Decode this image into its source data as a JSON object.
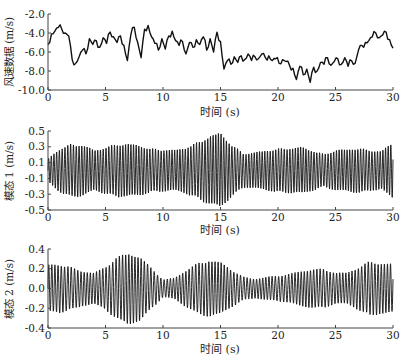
{
  "chart_data": [
    {
      "type": "line",
      "title": "",
      "xlabel": "时间 (s)",
      "ylabel": "风速数据 (m/s)",
      "xlim": [
        0,
        30
      ],
      "ylim": [
        -10.0,
        -2.0
      ],
      "xticks": [
        0,
        5,
        10,
        15,
        20,
        25,
        30
      ],
      "yticks": [
        -2.0,
        -4.0,
        -6.0,
        -8.0,
        -10.0
      ],
      "ytick_labels": [
        "-2.0",
        "-4.0",
        "-6.0",
        "-8.0",
        "-10.0"
      ],
      "grid": false,
      "line_color": "#111111",
      "series": [
        {
          "name": "风速数据",
          "x": [
            0,
            0.3,
            0.6,
            0.9,
            1.2,
            1.5,
            1.8,
            2.1,
            2.4,
            2.7,
            3.0,
            3.3,
            3.6,
            3.9,
            4.2,
            4.5,
            4.8,
            5.1,
            5.4,
            5.7,
            6.0,
            6.3,
            6.6,
            6.9,
            7.2,
            7.5,
            7.8,
            8.1,
            8.4,
            8.7,
            9.0,
            9.3,
            9.6,
            9.9,
            10.2,
            10.5,
            10.8,
            11.1,
            11.4,
            11.7,
            12.0,
            12.3,
            12.6,
            12.9,
            13.2,
            13.5,
            13.8,
            14.1,
            14.4,
            14.7,
            15.0,
            15.3,
            15.6,
            15.9,
            16.2,
            16.5,
            16.8,
            17.1,
            17.4,
            17.7,
            18.0,
            18.3,
            18.6,
            18.9,
            19.2,
            19.5,
            19.8,
            20.1,
            20.4,
            20.7,
            21.0,
            21.3,
            21.6,
            21.9,
            22.2,
            22.5,
            22.8,
            23.1,
            23.4,
            23.7,
            24.0,
            24.3,
            24.6,
            24.9,
            25.2,
            25.5,
            25.8,
            26.1,
            26.4,
            26.7,
            27.0,
            27.3,
            27.6,
            27.9,
            28.2,
            28.5,
            28.8,
            29.1,
            29.4,
            29.7,
            30.0
          ],
          "y": [
            -5.2,
            -4.1,
            -3.8,
            -3.4,
            -3.6,
            -4.0,
            -4.3,
            -6.8,
            -7.2,
            -6.5,
            -5.8,
            -6.2,
            -4.6,
            -5.2,
            -4.8,
            -5.5,
            -4.5,
            -5.1,
            -3.9,
            -4.4,
            -5.0,
            -4.3,
            -5.3,
            -6.9,
            -4.2,
            -3.4,
            -5.0,
            -6.6,
            -3.6,
            -3.2,
            -4.4,
            -5.1,
            -5.8,
            -4.6,
            -5.7,
            -4.3,
            -3.8,
            -4.8,
            -5.3,
            -4.9,
            -6.2,
            -5.0,
            -5.5,
            -4.7,
            -5.2,
            -4.4,
            -5.8,
            -4.6,
            -6.0,
            -3.9,
            -4.9,
            -7.8,
            -6.9,
            -7.3,
            -6.5,
            -7.1,
            -6.4,
            -6.8,
            -6.2,
            -6.9,
            -6.5,
            -6.7,
            -6.2,
            -6.6,
            -6.4,
            -6.9,
            -6.7,
            -7.2,
            -6.8,
            -7.0,
            -7.4,
            -7.7,
            -8.9,
            -7.5,
            -8.4,
            -7.8,
            -9.2,
            -7.6,
            -8.0,
            -7.1,
            -7.3,
            -6.6,
            -7.4,
            -7.0,
            -6.7,
            -7.3,
            -6.6,
            -7.5,
            -6.9,
            -7.2,
            -5.8,
            -5.3,
            -5.0,
            -4.8,
            -4.4,
            -4.0,
            -4.5,
            -4.2,
            -3.9,
            -4.7,
            -5.6,
            -3.8
          ]
        }
      ]
    },
    {
      "type": "line",
      "title": "",
      "xlabel": "时间 (s)",
      "ylabel": "模态 1 (m/s)",
      "xlim": [
        0,
        30
      ],
      "ylim": [
        -0.5,
        0.5
      ],
      "xticks": [
        0,
        5,
        10,
        15,
        20,
        25,
        30
      ],
      "yticks": [
        0.5,
        0.3,
        0.1,
        -0.1,
        -0.3,
        -0.5
      ],
      "ytick_labels": [
        "0.5",
        "0.3",
        "0.1",
        "-0.1",
        "-0.3",
        "-0.5"
      ],
      "grid": false,
      "line_color": "#111111",
      "oscillation_freq_hz": 4.2,
      "envelope": {
        "x": [
          0,
          1,
          2,
          3,
          4,
          5,
          6,
          7,
          8,
          9,
          10,
          11,
          12,
          13,
          14,
          15,
          16,
          17,
          18,
          19,
          20,
          21,
          22,
          23,
          24,
          25,
          26,
          27,
          28,
          29,
          30
        ],
        "amplitude": [
          0.15,
          0.28,
          0.34,
          0.33,
          0.26,
          0.3,
          0.34,
          0.34,
          0.32,
          0.28,
          0.27,
          0.26,
          0.3,
          0.36,
          0.44,
          0.48,
          0.33,
          0.22,
          0.23,
          0.26,
          0.28,
          0.29,
          0.3,
          0.26,
          0.21,
          0.26,
          0.27,
          0.29,
          0.26,
          0.25,
          0.36
        ]
      }
    },
    {
      "type": "line",
      "title": "",
      "xlabel": "时间 (s)",
      "ylabel": "模态 2 (m/s)",
      "xlim": [
        0,
        30
      ],
      "ylim": [
        -0.4,
        0.4
      ],
      "xticks": [
        0,
        5,
        10,
        15,
        20,
        25,
        30
      ],
      "yticks": [
        0.4,
        0.2,
        0.0,
        -0.2,
        -0.4
      ],
      "ytick_labels": [
        "0.4",
        "0.2",
        "0.0",
        "-0.2",
        "-0.4"
      ],
      "grid": false,
      "line_color": "#111111",
      "oscillation_freq_hz": 3.6,
      "envelope": {
        "x": [
          0,
          1,
          2,
          3,
          4,
          5,
          6,
          7,
          8,
          9,
          10,
          11,
          12,
          13,
          14,
          15,
          16,
          17,
          18,
          19,
          20,
          21,
          22,
          23,
          24,
          25,
          26,
          27,
          28,
          29,
          30
        ],
        "amplitude": [
          0.24,
          0.25,
          0.22,
          0.18,
          0.16,
          0.22,
          0.32,
          0.37,
          0.33,
          0.21,
          0.09,
          0.11,
          0.19,
          0.26,
          0.29,
          0.27,
          0.19,
          0.12,
          0.1,
          0.12,
          0.13,
          0.15,
          0.18,
          0.2,
          0.2,
          0.16,
          0.16,
          0.22,
          0.28,
          0.26,
          0.25
        ]
      }
    }
  ],
  "plots": [
    {
      "ylabel": "风速数据 (m/s)",
      "xlabel": "时间 (s)"
    },
    {
      "ylabel": "模态 1 (m/s)",
      "xlabel": "时间 (s)"
    },
    {
      "ylabel": "模态 2 (m/s)",
      "xlabel": "时间 (s)"
    }
  ]
}
